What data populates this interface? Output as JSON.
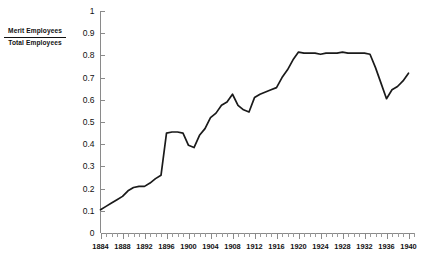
{
  "chart_data": {
    "type": "line",
    "title": "",
    "subtitle": "",
    "xlabel": "",
    "ylabel": "Merit Employees / Total Employees",
    "ylabel_numerator": "Merit Employees",
    "ylabel_denominator": "Total Employees",
    "xlim": [
      1884,
      1941
    ],
    "ylim": [
      0,
      1
    ],
    "grid": false,
    "legend": null,
    "legend_position": "none",
    "line_color": "#1a1a1a",
    "axis_color": "#8a8a8a",
    "y_ticks": [
      0,
      0.1,
      0.2,
      0.3,
      0.4,
      0.5,
      0.6,
      0.7,
      0.8,
      0.9,
      1
    ],
    "y_tick_labels": [
      "0",
      "0.1",
      "0.2",
      "0.3",
      "0.4",
      "0.5",
      "0.6",
      "0.7",
      "0.8",
      "0.9",
      "1"
    ],
    "x_tick_labels": [
      "1884",
      "1888",
      "1892",
      "1896",
      "1900",
      "1904",
      "1908",
      "1912",
      "1916",
      "1920",
      "1924",
      "1928",
      "1932",
      "1936",
      "1940"
    ],
    "x_tick_label_values": [
      1884,
      1888,
      1892,
      1896,
      1900,
      1904,
      1908,
      1912,
      1916,
      1920,
      1924,
      1928,
      1932,
      1936,
      1940
    ],
    "x_minor_tick_step": 1,
    "series": [
      {
        "name": "Merit Employees / Total Employees",
        "x": [
          1884,
          1885,
          1886,
          1887,
          1888,
          1889,
          1890,
          1891,
          1892,
          1893,
          1894,
          1895,
          1896,
          1897,
          1898,
          1899,
          1900,
          1901,
          1902,
          1903,
          1904,
          1905,
          1906,
          1907,
          1908,
          1909,
          1910,
          1911,
          1912,
          1913,
          1914,
          1915,
          1916,
          1917,
          1918,
          1919,
          1920,
          1921,
          1922,
          1923,
          1924,
          1925,
          1926,
          1927,
          1928,
          1929,
          1930,
          1931,
          1932,
          1933,
          1934,
          1935,
          1936,
          1937,
          1938,
          1939,
          1940
        ],
        "y": [
          0.105,
          0.12,
          0.135,
          0.15,
          0.165,
          0.19,
          0.205,
          0.21,
          0.21,
          0.225,
          0.245,
          0.26,
          0.45,
          0.455,
          0.455,
          0.45,
          0.395,
          0.385,
          0.44,
          0.47,
          0.52,
          0.54,
          0.575,
          0.59,
          0.625,
          0.575,
          0.555,
          0.545,
          0.61,
          0.625,
          0.635,
          0.645,
          0.655,
          0.7,
          0.735,
          0.78,
          0.815,
          0.81,
          0.81,
          0.81,
          0.805,
          0.81,
          0.81,
          0.81,
          0.815,
          0.81,
          0.81,
          0.81,
          0.81,
          0.805,
          0.745,
          0.675,
          0.605,
          0.645,
          0.66,
          0.685,
          0.72
        ]
      }
    ]
  }
}
